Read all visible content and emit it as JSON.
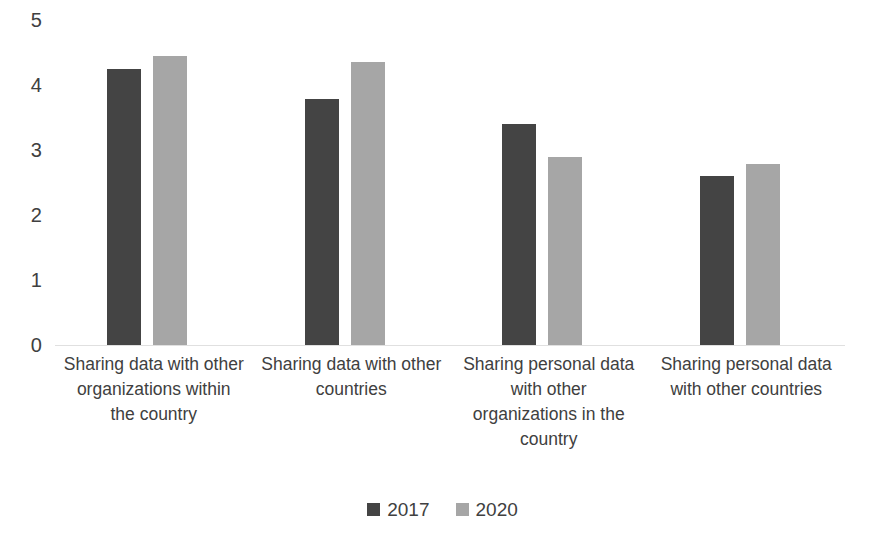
{
  "chart_data": {
    "type": "bar",
    "title": "",
    "subtitle": "",
    "xlabel": "",
    "ylabel": "",
    "ylim": [
      0,
      5
    ],
    "yticks": [
      0,
      1,
      2,
      3,
      4,
      5
    ],
    "ytick_labels": [
      "0",
      "1",
      "2",
      "3",
      "4",
      "5"
    ],
    "grid": false,
    "legend_position": "bottom",
    "categories": [
      "Sharing data with other organizations within the country",
      "Sharing data with other countries",
      "Sharing personal data with other organizations in the country",
      "Sharing personal data with other countries"
    ],
    "series": [
      {
        "name": "2017",
        "color": "#444444",
        "values": [
          4.25,
          3.78,
          3.4,
          2.6
        ]
      },
      {
        "name": "2020",
        "color": "#a6a6a6",
        "values": [
          4.45,
          4.35,
          2.9,
          2.78
        ]
      }
    ]
  },
  "axis": {
    "baseline_color": "#e0e0e0"
  },
  "legend": {
    "entries": [
      {
        "label": "2017",
        "color": "#444444"
      },
      {
        "label": "2020",
        "color": "#a6a6a6"
      }
    ]
  }
}
